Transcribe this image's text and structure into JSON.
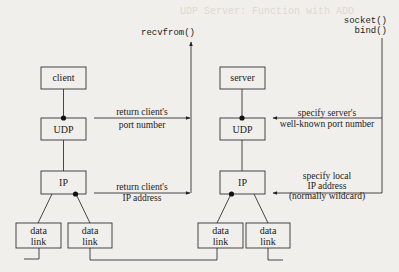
{
  "background_bleed_text": "UDP Server: Function with ADD",
  "client_host": {
    "app_label": "client",
    "udp_label": "UDP",
    "ip_label": "IP",
    "datalinks": [
      {
        "line1": "data",
        "line2": "link"
      },
      {
        "line1": "data",
        "line2": "link"
      }
    ]
  },
  "server_host": {
    "app_label": "server",
    "udp_label": "UDP",
    "ip_label": "IP",
    "datalinks": [
      {
        "line1": "data",
        "line2": "link"
      },
      {
        "line1": "data",
        "line2": "link"
      }
    ]
  },
  "client_side": {
    "function_label": "recvfrom()",
    "arrows": [
      {
        "line1": "return client's",
        "line2": "port number"
      },
      {
        "line1": "return client's",
        "line2": "IP address"
      }
    ]
  },
  "server_side": {
    "function_line1": "socket()",
    "function_line2": "bind()",
    "arrows": [
      {
        "line1": "specify server's",
        "line2": "well-known port number"
      },
      {
        "line1": "specify local",
        "line2": "IP address",
        "line3": "(normally wildcard)"
      }
    ]
  },
  "colors": {
    "line": "#333333",
    "background": "#f1efeb",
    "dot": "#111111"
  }
}
